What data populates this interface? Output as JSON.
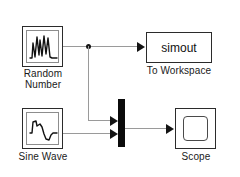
{
  "diagram": {
    "background_color": "#ffffff",
    "wire_color": "#9a9a9a",
    "block_border_color": "#2b2b2b",
    "mux_color": "#0b0b0b"
  },
  "blocks": {
    "random_number": {
      "label": "Random\nNumber",
      "icon": "random-signal-plot-icon",
      "type": "source"
    },
    "sine_wave": {
      "label": "Sine Wave",
      "icon": "sine-wave-plot-icon",
      "type": "source"
    },
    "to_workspace": {
      "label": "To Workspace",
      "value": "simout",
      "type": "sink"
    },
    "scope": {
      "label": "Scope",
      "icon": "scope-screen-icon",
      "type": "sink"
    },
    "mux": {
      "label": "",
      "icon": "mux-bar-icon",
      "type": "routing",
      "inputs": 2
    }
  },
  "connections": [
    {
      "name": "random-to-workspace",
      "from": "random_number",
      "to": "to_workspace"
    },
    {
      "name": "random-branch-to-mux",
      "from": "random_number",
      "to": "mux"
    },
    {
      "name": "sine-to-mux",
      "from": "sine_wave",
      "to": "mux"
    },
    {
      "name": "mux-to-scope",
      "from": "mux",
      "to": "scope"
    }
  ]
}
